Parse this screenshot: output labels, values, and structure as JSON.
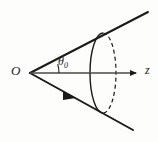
{
  "figure": {
    "type": "geometry-diagram",
    "background_color": "#fdfdfc",
    "stroke_color": "#1a1a1a",
    "labels": {
      "origin": "O",
      "axis": "z",
      "angle_symbol": "θ",
      "angle_subscript": "0"
    },
    "elements": [
      {
        "name": "cone-upper-generator",
        "kind": "line",
        "from": [
          30,
          73
        ],
        "to": [
          148,
          12
        ],
        "style": "solid"
      },
      {
        "name": "cone-lower-generator",
        "kind": "line",
        "from": [
          30,
          73
        ],
        "to": [
          133,
          130
        ],
        "style": "solid",
        "arrow_midpoint": true
      },
      {
        "name": "z-axis",
        "kind": "arrow-line",
        "from": [
          30,
          73
        ],
        "to": [
          141,
          73
        ],
        "style": "solid"
      },
      {
        "name": "angle-arc",
        "kind": "arc",
        "center": [
          30,
          73
        ],
        "radius": 29,
        "style": "solid"
      },
      {
        "name": "cap-ellipse-front",
        "kind": "ellipse-half",
        "center": [
          103,
          73
        ],
        "rx": 13,
        "ry": 40,
        "style": "solid"
      },
      {
        "name": "cap-ellipse-back",
        "kind": "ellipse-half",
        "center": [
          103,
          73
        ],
        "rx": 13,
        "ry": 40,
        "style": "dashed"
      }
    ]
  }
}
